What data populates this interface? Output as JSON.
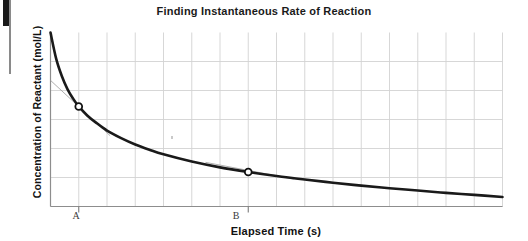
{
  "page": {
    "width": 528,
    "height": 241,
    "background": "#ffffff"
  },
  "artifacts": {
    "left_edge_line": "scan-edge-line",
    "left_edge_block": "scan-edge-block",
    "dust_speck": "speck"
  },
  "chart_data": {
    "type": "line",
    "title": "Finding Instantaneous Rate of Reaction",
    "xlabel": "Elapsed Time (s)",
    "ylabel": "Concentration of Reactant (mol/L)",
    "grid": true,
    "legend": "none",
    "xlim": [
      0,
      16
    ],
    "ylim": [
      0,
      6
    ],
    "xticklabels": [
      "A",
      "B"
    ],
    "yticklabels": [],
    "x_tick_values": [
      1,
      7
    ],
    "grid_columns": 16,
    "grid_rows": 6,
    "series": [
      {
        "name": "Concentration of reactant vs time",
        "style": "solid",
        "color": "#1a1a1a",
        "width": 2.6,
        "x": [
          0.0,
          0.2,
          0.4,
          0.6,
          0.8,
          1.0,
          1.3,
          1.6,
          2.0,
          2.5,
          3.0,
          3.5,
          4.0,
          5.0,
          6.0,
          7.0,
          8.0,
          9.0,
          10.0,
          11.0,
          12.0,
          13.0,
          14.0,
          15.0,
          16.0
        ],
        "y": [
          6.0,
          5.1,
          4.5,
          4.05,
          3.72,
          3.45,
          3.14,
          2.9,
          2.62,
          2.36,
          2.14,
          1.96,
          1.8,
          1.55,
          1.35,
          1.19,
          1.05,
          0.93,
          0.82,
          0.72,
          0.63,
          0.55,
          0.47,
          0.4,
          0.33
        ]
      }
    ],
    "annotations": [
      {
        "name": "point-a",
        "label": "A",
        "marker": "open-circle",
        "x": 1.0,
        "y": 3.45,
        "tangent": {
          "x1": 0.0,
          "y1": 4.35,
          "x2": 2.1,
          "y2": 2.45,
          "color": "#9a9a9a",
          "width": 0.8
        }
      },
      {
        "name": "point-b",
        "label": "B",
        "marker": "open-circle",
        "x": 7.0,
        "y": 1.19,
        "tangent": {
          "x1": 5.5,
          "y1": 1.52,
          "x2": 8.6,
          "y2": 0.95,
          "color": "#9a9a9a",
          "width": 0.8
        }
      }
    ],
    "axis_color": "#8d8d8d",
    "grid_color": "#d2d2d2"
  }
}
